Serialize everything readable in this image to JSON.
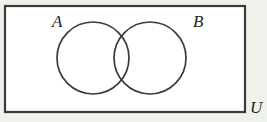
{
  "figure": {
    "kind": "venn-diagram",
    "caption": "",
    "background_color": "#eef2ea",
    "interior_color": "#ffffff",
    "stroke_color": "#3a3a3a"
  },
  "universe": {
    "label": "U",
    "label_position": "outside-bottom-right",
    "shape": "rectangle",
    "x": 5,
    "y": 6,
    "width": 240,
    "height": 106
  },
  "sets": [
    {
      "label": "A",
      "shape": "circle",
      "cx": 93,
      "cy": 58,
      "r": 36,
      "label_x": 52,
      "label_y": 27
    },
    {
      "label": "B",
      "shape": "circle",
      "cx": 150,
      "cy": 58,
      "r": 36,
      "label_x": 193,
      "label_y": 27
    }
  ],
  "regions": {
    "intersection_visible": true,
    "intersection_shaded": false,
    "fill": "none"
  }
}
